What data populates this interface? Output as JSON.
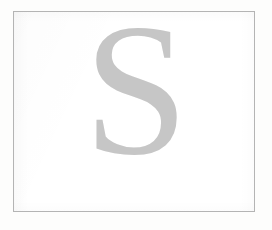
{
  "page": {
    "background_color": "#fdfdfc",
    "plate_background_color": "#ffffff"
  },
  "frame": {
    "name": "image-border-frame",
    "border_color": "#b4b4b4",
    "border_width_px": 1,
    "left_px": 13,
    "top_px": 11,
    "width_px": 242,
    "height_px": 201
  },
  "glyph": {
    "character": "S",
    "description": "large serif capital letter S",
    "color": "#c6c6c6",
    "style": "serif",
    "weight": "regular",
    "font_size_px": 188,
    "offset_x_px": 2,
    "baseline_y_px": 141
  }
}
